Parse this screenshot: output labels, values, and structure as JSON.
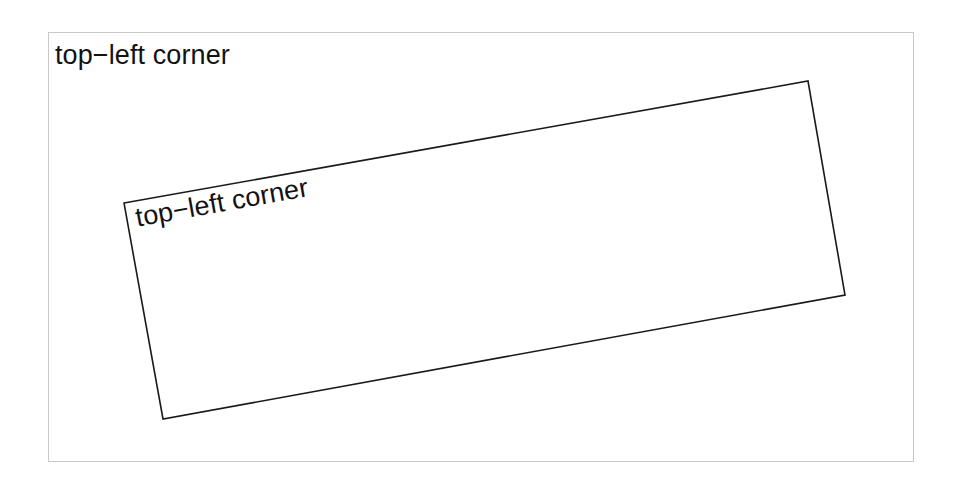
{
  "canvas": {
    "width": 963,
    "height": 490,
    "background_color": "#ffffff"
  },
  "outer_frame": {
    "border_color": "#c9c9c9",
    "border_width_px": 1,
    "x": 48,
    "y": 32,
    "width": 866,
    "height": 430
  },
  "labels": {
    "axes_label": "top−left corner",
    "rotated_label": "top−left corner",
    "text_color": "#121212",
    "font_size_px": 27
  },
  "rotated_rectangle": {
    "stroke_color": "#1a1a1a",
    "stroke_width_px": 1.6,
    "fill": "none",
    "rotation_degrees": -10.1,
    "points": "124,203 808,81 845,295 163,419",
    "corners": [
      {
        "name": "top-left",
        "x": 124,
        "y": 203
      },
      {
        "name": "top-right",
        "x": 808,
        "y": 81
      },
      {
        "name": "bottom-right",
        "x": 845,
        "y": 295
      },
      {
        "name": "bottom-left",
        "x": 163,
        "y": 419
      }
    ]
  }
}
